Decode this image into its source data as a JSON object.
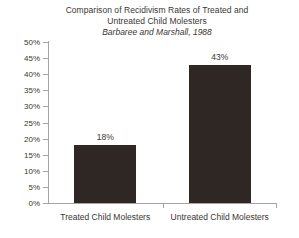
{
  "chart_data": {
    "type": "bar",
    "title": "Comparison of Recidivism Rates of Treated and Untreated Child Molesters",
    "title_lines": [
      "Comparison of Recidivism Rates of Treated and",
      "Untreated Child Molesters"
    ],
    "subtitle": "Barbaree and Marshall, 1988",
    "categories": [
      "Treated Child Molesters",
      "Untreated Child Molesters"
    ],
    "values": [
      18,
      43
    ],
    "value_labels": [
      "18%",
      "43%"
    ],
    "xlabel": "",
    "ylabel": "",
    "ylim": [
      0,
      50
    ],
    "ytick_step": 5,
    "ytick_labels": [
      "50%",
      "45%",
      "40%",
      "35%",
      "30%",
      "25%",
      "20%",
      "15%",
      "10%",
      "5%",
      "0%"
    ],
    "ytick_values": [
      50,
      45,
      40,
      35,
      30,
      25,
      20,
      15,
      10,
      5,
      0
    ],
    "grid": false,
    "legend": false,
    "bar_color": "#2e2724",
    "axis_color": "#a8a49f",
    "text_color": "#3a3633",
    "background": "#ffffff"
  }
}
